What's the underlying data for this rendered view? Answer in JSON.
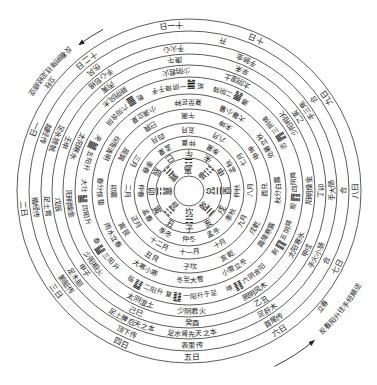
{
  "diagram": {
    "rings": [
      {
        "id": "days",
        "labels": [
          {
            "text": "一日",
            "angle": 202
          },
          {
            "text": "二日",
            "angle": 174
          },
          {
            "text": "三日",
            "angle": 143
          },
          {
            "text": "四日",
            "angle": 114
          },
          {
            "text": "五日",
            "angle": 89
          },
          {
            "text": "六日",
            "angle": 57
          },
          {
            "text": "七日",
            "angle": 27
          },
          {
            "text": "八日",
            "angle": 0
          },
          {
            "text": "九日",
            "angle": 326
          },
          {
            "text": "十日",
            "angle": 294
          },
          {
            "text": "十一日",
            "angle": 264
          },
          {
            "text": "十二日",
            "angle": 232
          }
        ]
      },
      {
        "id": "transmission",
        "labels": [
          {
            "text": "越经传",
            "angle": 202
          },
          {
            "text": "循经传",
            "angle": 174
          },
          {
            "text": "腑脏传",
            "angle": 143
          },
          {
            "text": "顶下传",
            "angle": 114
          },
          {
            "text": "表里传",
            "angle": 89
          },
          {
            "text": "首尾传",
            "angle": 57
          },
          {
            "text": "合",
            "angle": 27
          },
          {
            "text": "合",
            "angle": 0
          },
          {
            "text": "合",
            "angle": 324
          },
          {
            "text": "开",
            "angle": 283
          },
          {
            "text": "伤风",
            "angle": 232
          }
        ]
      },
      {
        "id": "meridians",
        "labels": [
          {
            "text": "足水膀胱",
            "angle": 202
          },
          {
            "text": "足土胃",
            "angle": 174
          },
          {
            "text": "足木胆",
            "angle": 143
          },
          {
            "text": "足土脾后天之本",
            "angle": 114
          },
          {
            "text": "足水肾先天之本",
            "angle": 89
          },
          {
            "text": "足肝木",
            "angle": 57
          },
          {
            "text": "手火小肠",
            "angle": 27
          },
          {
            "text": "手大肠",
            "angle": 0
          },
          {
            "text": "手三焦",
            "angle": 326
          },
          {
            "text": "手肺金",
            "angle": 294
          },
          {
            "text": "手火心",
            "angle": 264
          },
          {
            "text": "手心包络",
            "angle": 232
          }
        ]
      },
      {
        "id": "stems_branches",
        "labels": [
          {
            "text": "壬申",
            "angle": 202
          },
          {
            "text": "戊辰",
            "angle": 174
          },
          {
            "text": "甲子",
            "angle": 143
          },
          {
            "text": "己巳",
            "angle": 114
          },
          {
            "text": "癸酉",
            "angle": 89
          },
          {
            "text": "乙丑",
            "angle": 57
          },
          {
            "text": "甲戌",
            "angle": 27
          },
          {
            "text": "丁卯",
            "angle": 0
          },
          {
            "text": "乙亥",
            "angle": 326
          },
          {
            "text": "辛未",
            "angle": 294
          },
          {
            "text": "庚午",
            "angle": 264
          },
          {
            "text": "丙寅",
            "angle": 232
          }
        ]
      },
      {
        "id": "six_qi",
        "labels": [
          {
            "text": "少阴君火",
            "angle": 89
          },
          {
            "text": "太阴湿土",
            "angle": 114
          },
          {
            "text": "少阳相火",
            "angle": 143
          },
          {
            "text": "阳明燥金",
            "angle": 174
          },
          {
            "text": "太阳寒水",
            "angle": 202
          },
          {
            "text": "厥阴风木",
            "angle": 232
          },
          {
            "text": "少阴君火",
            "angle": 264
          },
          {
            "text": "太阴湿土",
            "angle": 294
          },
          {
            "text": "少阳相火",
            "angle": 326
          },
          {
            "text": "阳明燥金",
            "angle": 0
          },
          {
            "text": "太阳寒水",
            "angle": 27
          },
          {
            "text": "厥阴风木",
            "angle": 57
          }
        ]
      },
      {
        "id": "hexagrams",
        "labels": [
          {
            "name": "复",
            "symbol": "䷗",
            "text": "一阳升于足",
            "angle": 89
          },
          {
            "name": "临",
            "symbol": "䷒",
            "text": "二阳升",
            "angle": 115
          },
          {
            "name": "泰",
            "symbol": "䷊",
            "text": "三阳升",
            "angle": 143
          },
          {
            "name": "大壮",
            "symbol": "䷡",
            "text": "四阳升",
            "angle": 174
          },
          {
            "name": "夬",
            "symbol": "䷪",
            "text": "五阳升",
            "angle": 202
          },
          {
            "name": "乾",
            "symbol": "䷀",
            "text": "六阳含阴",
            "angle": 232
          },
          {
            "name": "姤",
            "symbol": "䷫",
            "text": "一阴降于手",
            "angle": 264
          },
          {
            "name": "遁",
            "symbol": "䷠",
            "text": "二阴降",
            "angle": 294
          },
          {
            "name": "否",
            "symbol": "䷋",
            "text": "三阴降",
            "angle": 326
          },
          {
            "name": "观",
            "symbol": "䷓",
            "text": "四阴降",
            "angle": 0
          },
          {
            "name": "剥",
            "symbol": "䷖",
            "text": "五阴降",
            "angle": 27
          },
          {
            "name": "坤",
            "symbol": "䷁",
            "text": "六阴含阳",
            "angle": 57
          }
        ]
      },
      {
        "id": "solar_terms",
        "labels": [
          {
            "text": "冬至大雪",
            "angle": 90
          },
          {
            "text": "大寒小寒",
            "angle": 120
          },
          {
            "text": "雨水立春",
            "angle": 150
          },
          {
            "text": "春分惊蛰",
            "angle": 180
          },
          {
            "text": "谷雨清明",
            "angle": 210
          },
          {
            "text": "小满立夏",
            "angle": 240
          },
          {
            "text": "夏至芒种",
            "angle": 270
          },
          {
            "text": "大暑小暑",
            "angle": 300
          },
          {
            "text": "处暑立秋",
            "angle": 330
          },
          {
            "text": "秋分白露",
            "angle": 0
          },
          {
            "text": "霜降寒露",
            "angle": 30
          },
          {
            "text": "小雪立冬",
            "angle": 60
          }
        ]
      },
      {
        "id": "branch_trigrams",
        "labels": [
          {
            "text": "子坎",
            "angle": 90
          },
          {
            "text": "丑艮",
            "angle": 120
          },
          {
            "text": "寅艮",
            "angle": 150
          },
          {
            "text": "卯震",
            "angle": 180
          },
          {
            "text": "辰巽",
            "angle": 210
          },
          {
            "text": "巳巽",
            "angle": 240
          },
          {
            "text": "午离",
            "angle": 270
          },
          {
            "text": "未坤",
            "angle": 300
          },
          {
            "text": "申坤",
            "angle": 330
          },
          {
            "text": "酉兑",
            "angle": 0
          },
          {
            "text": "戌乾",
            "angle": 30
          },
          {
            "text": "亥乾",
            "angle": 60
          }
        ]
      },
      {
        "id": "months",
        "labels": [
          {
            "text": "十一月",
            "angle": 90
          },
          {
            "text": "十二月",
            "angle": 120
          },
          {
            "text": "正月",
            "angle": 150
          },
          {
            "text": "二月",
            "angle": 180
          },
          {
            "text": "三月",
            "angle": 210
          },
          {
            "text": "四月",
            "angle": 240
          },
          {
            "text": "五月",
            "angle": 270
          },
          {
            "text": "六月",
            "angle": 300
          },
          {
            "text": "七月",
            "angle": 330
          },
          {
            "text": "八月",
            "angle": 0
          },
          {
            "text": "九月",
            "angle": 30
          },
          {
            "text": "十月",
            "angle": 60
          }
        ]
      },
      {
        "id": "seasons",
        "labels": [
          {
            "text": "仲冬",
            "angle": 90
          },
          {
            "text": "季冬",
            "angle": 120
          },
          {
            "text": "孟春",
            "angle": 150
          },
          {
            "text": "仲春",
            "angle": 180
          },
          {
            "text": "季春",
            "angle": 210
          },
          {
            "text": "孟夏",
            "angle": 240
          },
          {
            "text": "仲夏",
            "angle": 270
          },
          {
            "text": "季夏",
            "angle": 300
          },
          {
            "text": "孟秋",
            "angle": 330
          },
          {
            "text": "仲秋",
            "angle": 0
          },
          {
            "text": "季秋",
            "angle": 30
          },
          {
            "text": "孟冬",
            "angle": 60
          }
        ]
      },
      {
        "id": "branches",
        "labels": [
          {
            "text": "子",
            "angle": 90
          },
          {
            "text": "丑",
            "angle": 120
          },
          {
            "text": "寅",
            "angle": 150
          },
          {
            "text": "卯",
            "angle": 180
          },
          {
            "text": "辰",
            "angle": 210
          },
          {
            "text": "巳",
            "angle": 240
          },
          {
            "text": "午",
            "angle": 270
          },
          {
            "text": "未",
            "angle": 300
          },
          {
            "text": "申",
            "angle": 330
          },
          {
            "text": "酉",
            "angle": 0
          },
          {
            "text": "戌",
            "angle": 30
          },
          {
            "text": "亥",
            "angle": 60
          }
        ]
      }
    ],
    "trigrams": [
      {
        "name": "离",
        "symbol": "☲",
        "angle": 270
      },
      {
        "name": "坤",
        "symbol": "☷",
        "angle": 315
      },
      {
        "name": "兑",
        "symbol": "☱",
        "angle": 0
      },
      {
        "name": "乾",
        "symbol": "☰",
        "angle": 45
      },
      {
        "name": "坎",
        "symbol": "☵",
        "angle": 90
      },
      {
        "name": "艮",
        "symbol": "☶",
        "angle": 135
      },
      {
        "name": "震",
        "symbol": "☳",
        "angle": 180
      },
      {
        "name": "巽",
        "symbol": "☴",
        "angle": 225
      }
    ],
    "annotations": [
      {
        "id": "note_top_left",
        "text": "反看阴降往足经顺逆",
        "angle": 221
      },
      {
        "id": "note_bottom_right",
        "text": "反看阳升往手经顺逆",
        "angle": 38
      },
      {
        "id": "marker_autumn",
        "text": "立秋",
        "angle": 218
      },
      {
        "id": "marker_spring",
        "text": "立春",
        "angle": 41
      }
    ]
  }
}
